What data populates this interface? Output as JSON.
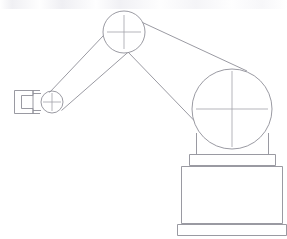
{
  "figure": {
    "type": "line-drawing",
    "background_color": "#ffffff",
    "line_color": "#8f8f97",
    "crosshair_color": "#a2a2aa",
    "line_width": 0.9,
    "canvas": {
      "width": 287,
      "height": 239
    }
  },
  "parts": {
    "gripper": {
      "label": "gripper",
      "description": "C-shaped two-finger clamp at the end of the forearm",
      "outline_points": "14,90 33,90 33,95 22,95 22,109 33,109 33,114 14,114",
      "jaw_gap_points": "33,95 22,95 22,109 33,109",
      "wrist_plate_points": "33,93 40,93 40,111 33,111",
      "bbox": {
        "x": 14,
        "y": 90,
        "width": 26,
        "height": 24
      }
    },
    "wrist_joint": {
      "label": "wrist joint",
      "description": "small pivot circle with crosshair between gripper and forearm",
      "center": {
        "x": 52,
        "y": 102
      },
      "radius": 11,
      "crosshair_arm": 9
    },
    "forearm": {
      "label": "forearm link",
      "description": "tapered link from wrist joint up to elbow joint",
      "edge_upper_points": "50,92 114,26",
      "edge_lower_points": "62,110 133,47",
      "bbox": {
        "x": 50,
        "y": 26,
        "width": 83,
        "height": 84
      }
    },
    "elbow_joint": {
      "label": "elbow joint",
      "description": "mid pivot circle with crosshair joining forearm and upper arm",
      "center": {
        "x": 124,
        "y": 32
      },
      "radius": 21,
      "crosshair_arm": 17
    },
    "upper_arm": {
      "label": "upper arm link",
      "description": "tapered link from elbow joint down to the shoulder body circle",
      "edge_upper_points": "143,23 245,70",
      "edge_lower_points": "129,53 209,136",
      "bbox": {
        "x": 129,
        "y": 23,
        "width": 116,
        "height": 113
      }
    },
    "shoulder_body": {
      "label": "shoulder body",
      "description": "large rotating body circle with crosshair",
      "center": {
        "x": 232,
        "y": 109
      },
      "radius": 40,
      "crosshair_arm_horizontal": 36,
      "crosshair_arm_vertical": 38
    },
    "neck_collar": {
      "label": "neck collar",
      "description": "short vertical housing below the shoulder body",
      "points": "196,135 196,154 269,154 269,135",
      "bbox": {
        "x": 196,
        "y": 135,
        "width": 73,
        "height": 19
      }
    },
    "collar_plate": {
      "label": "collar plate",
      "description": "flat plate capping the base column",
      "points": "189,154 189,166 276,166 276,154",
      "bbox": {
        "x": 189,
        "y": 154,
        "width": 87,
        "height": 12
      }
    },
    "base_column": {
      "label": "base column",
      "description": "main rectangular pedestal body",
      "points": "181,166 181,224 283,224 283,166",
      "bbox": {
        "x": 181,
        "y": 166,
        "width": 102,
        "height": 58
      }
    },
    "floor_plate": {
      "label": "floor plate",
      "description": "wide bottom mounting plate resting on the floor",
      "points": "177,224 177,236 287,236 287,224",
      "bbox": {
        "x": 177,
        "y": 224,
        "width": 110,
        "height": 12
      }
    }
  },
  "artifacts": {
    "top_scan_noise": {
      "label": "faint scan noise band",
      "description": "very light gray speckle band across the top edge of the scanned drawing",
      "visible": true
    }
  }
}
